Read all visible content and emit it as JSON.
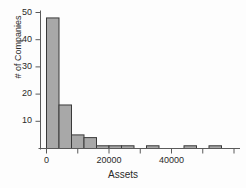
{
  "chart_data": {
    "type": "bar",
    "title": "",
    "subtitle": "",
    "xlabel": "Assets",
    "ylabel": "# of Companies",
    "bin_width": 4000,
    "bin_starts": [
      0,
      4000,
      8000,
      12000,
      16000,
      20000,
      24000,
      28000,
      32000,
      36000,
      40000,
      44000,
      48000,
      52000,
      56000
    ],
    "categories": [
      "0-4000",
      "4000-8000",
      "8000-12000",
      "12000-16000",
      "16000-20000",
      "20000-24000",
      "24000-28000",
      "28000-32000",
      "32000-36000",
      "36000-40000",
      "40000-44000",
      "44000-48000",
      "48000-52000",
      "52000-56000",
      "56000-60000"
    ],
    "values": [
      48,
      16,
      5,
      4,
      1,
      1,
      1,
      0,
      1,
      0,
      0,
      1,
      0,
      1,
      0
    ],
    "xlim": [
      -2000,
      62000
    ],
    "ylim": [
      0,
      52
    ],
    "xticks": [
      0,
      20000,
      40000
    ],
    "xtick_labels": [
      "0",
      "20000",
      "40000"
    ],
    "xminor_ticks": [
      10000,
      30000,
      50000,
      60000
    ],
    "yticks": [
      10,
      20,
      30,
      40,
      50
    ],
    "ytick_labels": [
      "10",
      "20",
      "30",
      "40",
      "50"
    ],
    "grid": false,
    "legend": "none",
    "bar_fill": "#a8a8a8",
    "bar_edge": "#3a3a3a",
    "axis_color": "#5a5a5a",
    "text_color": "#2a2a2a",
    "background": "#fdfdfd"
  }
}
